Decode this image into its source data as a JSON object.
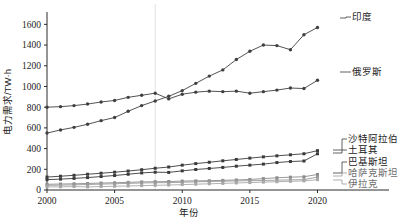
{
  "chart_data": {
    "type": "line",
    "title": "",
    "xlabel": "年份",
    "ylabel": "电力需求/TW·h",
    "xlim": [
      2000,
      2021
    ],
    "ylim": [
      0,
      1700
    ],
    "yticks": [
      0,
      200,
      400,
      600,
      800,
      1000,
      1200,
      1400,
      1600
    ],
    "xticks": [
      2000,
      2005,
      2010,
      2015,
      2020
    ],
    "grid": false,
    "vertical_reference_line": 2008,
    "legend_position": "right-inline-labels",
    "x": [
      2000,
      2001,
      2002,
      2003,
      2004,
      2005,
      2006,
      2007,
      2008,
      2009,
      2010,
      2011,
      2012,
      2013,
      2014,
      2015,
      2016,
      2017,
      2018,
      2019,
      2020
    ],
    "series": [
      {
        "name": "印度",
        "color": "#404040",
        "marker": "circle",
        "values": [
          550,
          580,
          605,
          635,
          670,
          700,
          760,
          815,
          860,
          905,
          960,
          1030,
          1100,
          1160,
          1260,
          1340,
          1400,
          1395,
          1355,
          1500,
          1570
        ]
      },
      {
        "name": "俄罗斯",
        "color": "#404040",
        "marker": "circle",
        "values": [
          800,
          805,
          815,
          830,
          850,
          865,
          895,
          915,
          935,
          880,
          925,
          945,
          955,
          950,
          955,
          935,
          950,
          965,
          985,
          980,
          1060
        ]
      },
      {
        "name": "沙特阿拉伯",
        "color": "#3a3a3a",
        "marker": "square",
        "values": [
          125,
          133,
          142,
          152,
          162,
          172,
          183,
          196,
          210,
          222,
          240,
          255,
          268,
          282,
          295,
          308,
          320,
          330,
          340,
          350,
          380
        ]
      },
      {
        "name": "土耳其",
        "color": "#3a3a3a",
        "marker": "square",
        "values": [
          100,
          105,
          112,
          120,
          130,
          140,
          152,
          165,
          172,
          170,
          185,
          198,
          208,
          218,
          230,
          240,
          250,
          265,
          275,
          280,
          350
        ]
      },
      {
        "name": "巴基斯坦",
        "color": "#8c8c8c",
        "marker": "square",
        "values": [
          55,
          58,
          60,
          63,
          67,
          70,
          74,
          78,
          80,
          82,
          86,
          88,
          90,
          93,
          97,
          102,
          110,
          118,
          124,
          128,
          150
        ]
      },
      {
        "name": "哈萨克斯坦",
        "color": "#9a9a9a",
        "marker": "square",
        "values": [
          45,
          47,
          50,
          53,
          57,
          60,
          64,
          68,
          70,
          71,
          75,
          79,
          82,
          85,
          88,
          90,
          92,
          95,
          98,
          100,
          125
        ]
      },
      {
        "name": "伊拉克",
        "color": "#a8a8a8",
        "marker": "square",
        "values": [
          30,
          31,
          33,
          30,
          33,
          36,
          39,
          42,
          45,
          48,
          52,
          56,
          60,
          64,
          68,
          72,
          76,
          80,
          84,
          88,
          100
        ]
      }
    ],
    "label_anchors": [
      {
        "name": "印度",
        "lx": 352,
        "ly": 20,
        "px": 340,
        "py": 18,
        "faint": false
      },
      {
        "name": "俄罗斯",
        "lx": 352,
        "ly": 75,
        "px": 340,
        "py": 72,
        "faint": false
      },
      {
        "name": "沙特阿拉伯",
        "lx": 348,
        "ly": 142,
        "px": 333,
        "py": 150,
        "faint": false
      },
      {
        "name": "土耳其",
        "lx": 348,
        "ly": 153,
        "px": 333,
        "py": 153,
        "faint": false
      },
      {
        "name": "巴基斯坦",
        "lx": 348,
        "ly": 165,
        "px": 333,
        "py": 173,
        "faint": false
      },
      {
        "name": "哈萨克斯坦",
        "lx": 348,
        "ly": 176,
        "px": 333,
        "py": 176,
        "faint": true
      },
      {
        "name": "伊拉克",
        "lx": 348,
        "ly": 187,
        "px": 333,
        "py": 180,
        "faint": true
      }
    ]
  }
}
